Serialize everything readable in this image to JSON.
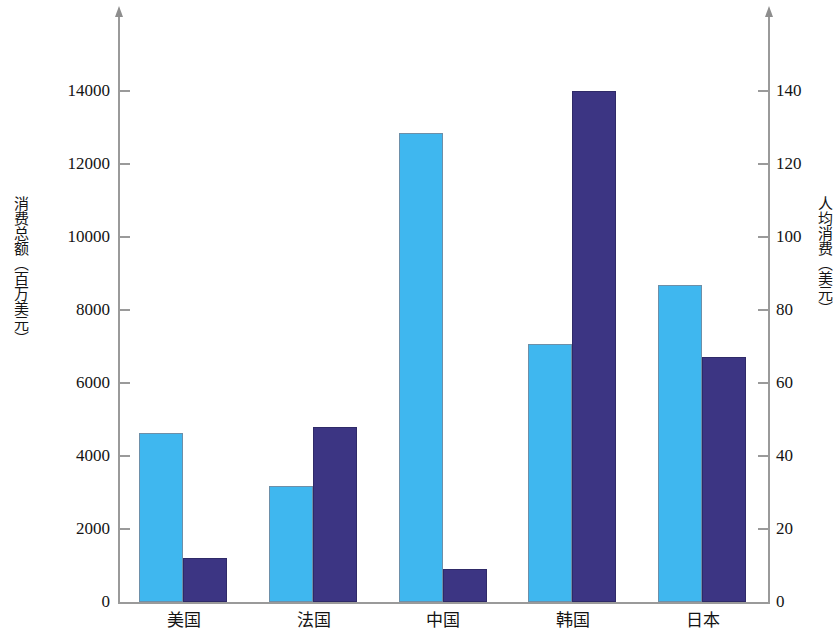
{
  "chart_data": {
    "type": "bar",
    "title": "",
    "categories": [
      "美国",
      "法国",
      "中国",
      "韩国",
      "日本"
    ],
    "series": [
      {
        "name": "消费总额（百万美元）",
        "axis": "left",
        "color": "#3fb7ef",
        "values": [
          4640,
          3180,
          12850,
          7080,
          8680
        ]
      },
      {
        "name": "人均消费（美元）",
        "axis": "right",
        "color": "#3c3583",
        "values": [
          12,
          48,
          9,
          140,
          67
        ]
      }
    ],
    "xlabel": "",
    "ylabel": "消费总额（百万美元）",
    "y2label": "人均消费（美元）",
    "ylim": [
      0,
      15000
    ],
    "y2lim": [
      0,
      150
    ],
    "yticks": [
      0,
      2000,
      4000,
      6000,
      8000,
      10000,
      12000,
      14000
    ],
    "yticklabels": [
      "0",
      "2000",
      "4000",
      "6000",
      "8000",
      "10000",
      "12000",
      "14000"
    ],
    "y2ticks": [
      0,
      20,
      40,
      60,
      80,
      100,
      120,
      140
    ],
    "y2ticklabels": [
      "0",
      "20",
      "40",
      "60",
      "80",
      "100",
      "120",
      "140"
    ],
    "grid": false,
    "legend": "none"
  },
  "axes": {
    "left_title": "消费总额（百万美元）",
    "right_title": "人均消费（美元）"
  }
}
